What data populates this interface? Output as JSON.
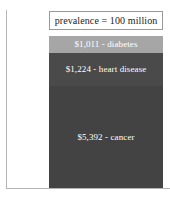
{
  "chart_data": {
    "type": "bar",
    "orientation": "vertical-stacked",
    "title": "prevalence = 100 million",
    "xlabel": "",
    "ylabel": "",
    "grid": false,
    "legend": "none",
    "categories": [
      "diabetes",
      "heart disease",
      "cancer"
    ],
    "values": [
      1011,
      1224,
      5392
    ],
    "value_prefix": "$",
    "data_labels": [
      "$1,011 - diabetes",
      "$1,224 - heart disease",
      "$5,392 - cancer"
    ],
    "series": [
      {
        "name": "cost per person",
        "values": [
          1011,
          1224,
          5392
        ]
      }
    ],
    "segment_colors": [
      "#a6a6a6",
      "#4a4a4a",
      "#434343"
    ],
    "label_color": "#ffffff",
    "ylim": [
      0,
      7627
    ]
  },
  "header": {
    "title": "prevalence = 100 million"
  },
  "bar": {
    "segments": [
      {
        "key": "diabetes",
        "label": "$1,011 - diabetes",
        "amount": "$1,011",
        "name": "diabetes",
        "color": "#a6a6a6"
      },
      {
        "key": "heart-disease",
        "label": "$1,224 - heart disease",
        "amount": "$1,224",
        "name": "heart disease",
        "color": "#4a4a4a"
      },
      {
        "key": "cancer",
        "label": "$5,392 - cancer",
        "amount": "$5,392",
        "name": "cancer",
        "color": "#434343"
      }
    ]
  },
  "axes": {
    "line_color": "#b4b4b4"
  }
}
